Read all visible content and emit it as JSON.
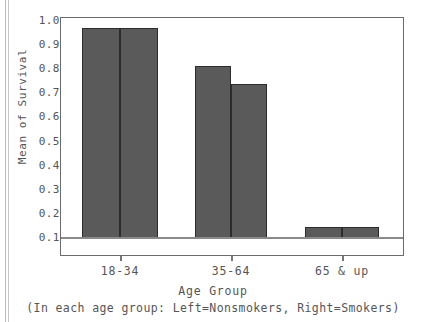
{
  "chart_data": {
    "type": "bar",
    "title": "",
    "xlabel": "Age Group",
    "ylabel": "Mean of Survival",
    "note": "(In each age group: Left=Nonsmokers, Right=Smokers)",
    "categories": [
      "18-34",
      "35-64",
      "65 & up"
    ],
    "series": [
      {
        "name": "Nonsmokers",
        "values": [
          0.97,
          0.815,
          0.145
        ]
      },
      {
        "name": "Smokers",
        "values": [
          0.97,
          0.74,
          0.145
        ]
      }
    ],
    "ylim": [
      0.1,
      1.0
    ],
    "ytick_labels": [
      "1.0",
      "0.9",
      "0.8",
      "0.7",
      "0.6",
      "0.5",
      "0.4",
      "0.3",
      "0.2",
      "0.1"
    ],
    "ytick_values": [
      1.0,
      0.9,
      0.8,
      0.7,
      0.6,
      0.5,
      0.4,
      0.3,
      0.2,
      0.1
    ],
    "grid": false,
    "legend_position": "none",
    "bar_color": "#5a5a5a",
    "bar_edge_color": "#2c2c2c",
    "axis_color": "#6b6b6b",
    "text_color": "#555555"
  }
}
